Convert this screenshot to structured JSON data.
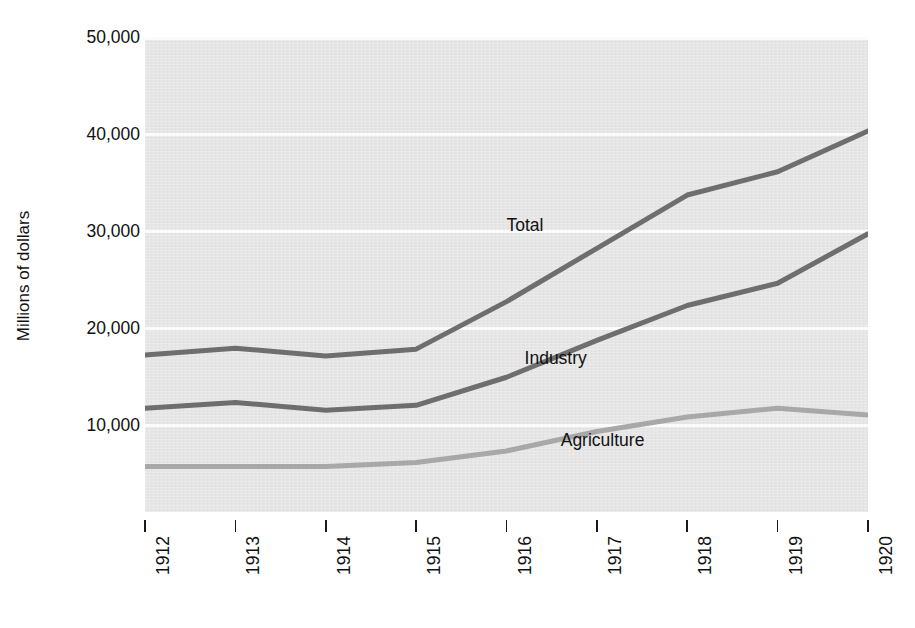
{
  "chart_data": {
    "type": "line",
    "title": "",
    "xlabel": "",
    "ylabel": "Millions of dollars",
    "categories": [
      "1912",
      "1913",
      "1914",
      "1915",
      "1916",
      "1917",
      "1918",
      "1919",
      "1920"
    ],
    "x": [
      1912,
      1913,
      1914,
      1915,
      1916,
      1917,
      1918,
      1919,
      1920
    ],
    "ylim": [
      1100,
      50000
    ],
    "xlim": [
      1912,
      1920
    ],
    "yticks": [
      10000,
      20000,
      30000,
      40000,
      50000
    ],
    "ytick_labels": [
      "10,000",
      "20,000",
      "30,000",
      "40,000",
      "50,000"
    ],
    "grid": "horizontal",
    "legend_position": "inline-annotations",
    "series": [
      {
        "name": "Total",
        "color": "#6e6e6e",
        "values": [
          17300,
          18000,
          17200,
          17900,
          22800,
          28300,
          33800,
          36200,
          40400
        ]
      },
      {
        "name": "Industry",
        "color": "#6e6e6e",
        "values": [
          11800,
          12400,
          11600,
          12100,
          15000,
          18800,
          22400,
          24700,
          29800
        ]
      },
      {
        "name": "Agriculture",
        "color": "#a8a8a8",
        "values": [
          5800,
          5800,
          5800,
          6200,
          7400,
          9400,
          10900,
          11800,
          11100
        ]
      }
    ],
    "annotations": [
      {
        "text": "Total",
        "x": 1916.0,
        "y": 30600
      },
      {
        "text": "Industry",
        "x": 1916.2,
        "y": 16900
      },
      {
        "text": "Agriculture",
        "x": 1916.6,
        "y": 8450
      }
    ]
  },
  "colors": {
    "plot_background": "#e8e8e8",
    "gridline": "#fbfbfb",
    "page_background": "#ffffff",
    "text": "#111111",
    "total_line": "#6e6e6e",
    "industry_line": "#6e6e6e",
    "agriculture_line": "#a8a8a8"
  }
}
